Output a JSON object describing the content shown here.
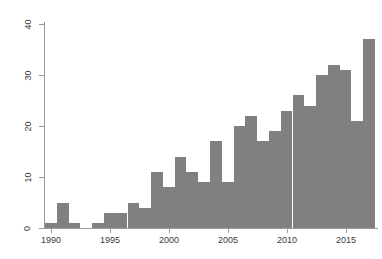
{
  "chart_data": {
    "type": "bar",
    "title": "",
    "subtitle": "",
    "xlabel": "",
    "ylabel": "",
    "categories": [
      "1990",
      "1991",
      "1992",
      "1993",
      "1994",
      "1995",
      "1996",
      "1997",
      "1998",
      "1999",
      "2000",
      "2001",
      "2002",
      "2003",
      "2004",
      "2005",
      "2006",
      "2007",
      "2008",
      "2009",
      "2010",
      "2011",
      "2012",
      "2013",
      "2014",
      "2015",
      "2016",
      "2017"
    ],
    "values": [
      1,
      5,
      1,
      0,
      1,
      3,
      3,
      5,
      4,
      11,
      8,
      14,
      11,
      9,
      17,
      9,
      20,
      22,
      17,
      19,
      23,
      26,
      24,
      30,
      32,
      31,
      21,
      37
    ],
    "x": [
      1990,
      1991,
      1992,
      1993,
      1994,
      1995,
      1996,
      1997,
      1998,
      1999,
      2000,
      2001,
      2002,
      2003,
      2004,
      2005,
      2006,
      2007,
      2008,
      2009,
      2010,
      2011,
      2012,
      2013,
      2014,
      2015,
      2016,
      2017
    ],
    "xlim": [
      1989.5,
      1929.5
    ],
    "ylim": [
      0,
      40
    ],
    "x_tick_labels": [
      "1990",
      "1995",
      "2000",
      "2005",
      "2010",
      "2015"
    ],
    "x_tick_values": [
      1990,
      1995,
      2000,
      2005,
      2010,
      2015
    ],
    "y_tick_labels": [
      "0",
      "10",
      "20",
      "30",
      "40"
    ],
    "y_tick_values": [
      0,
      10,
      20,
      30,
      40
    ],
    "grid": false,
    "legend": null,
    "legend_position": "none",
    "bar_color": "#808080",
    "axis_color": "#9a9a9a",
    "background_color": "#ffffff"
  }
}
